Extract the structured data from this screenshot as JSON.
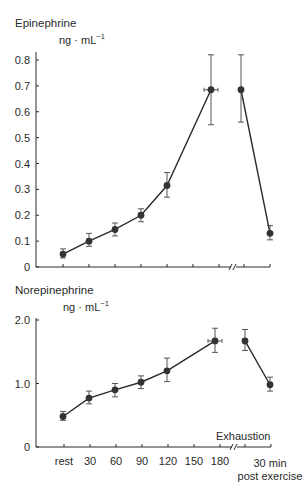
{
  "chart_data": [
    {
      "type": "line",
      "title": "Epinephrine",
      "ylabel": "ng · mL⁻¹",
      "ylim": [
        0,
        0.8
      ],
      "yticks": [
        "0",
        "0.1",
        "0.2",
        "0.3",
        "0.4",
        "0.5",
        "0.6",
        "0.7",
        "0.8"
      ],
      "categories": [
        "rest",
        "30",
        "60",
        "90",
        "120",
        "150",
        "180",
        "Exhaustion",
        "30 min post exercise"
      ],
      "axis_break": "between 180 and 30 min post exercise",
      "grid": false,
      "series": [
        {
          "name": "Epinephrine",
          "points": [
            {
              "x": "rest",
              "y": 0.05,
              "err_low": 0.035,
              "err_high": 0.07
            },
            {
              "x": "30",
              "y": 0.1,
              "err_low": 0.08,
              "err_high": 0.13
            },
            {
              "x": "60",
              "y": 0.145,
              "err_low": 0.12,
              "err_high": 0.17
            },
            {
              "x": "90",
              "y": 0.2,
              "err_low": 0.175,
              "err_high": 0.225
            },
            {
              "x": "120",
              "y": 0.315,
              "err_low": 0.27,
              "err_high": 0.365
            },
            {
              "x": "Exhaustion",
              "y": 0.685,
              "err_low": 0.55,
              "err_high": 0.82,
              "x_error": true
            },
            {
              "x": "Exhaustion (post)",
              "y": 0.685,
              "err_low": 0.56,
              "err_high": 0.82
            },
            {
              "x": "30 min post exercise",
              "y": 0.13,
              "err_low": 0.105,
              "err_high": 0.16
            }
          ]
        }
      ]
    },
    {
      "type": "line",
      "title": "Norepinephrine",
      "ylabel": "ng · mL⁻¹",
      "ylim": [
        0,
        2.0
      ],
      "yticks": [
        "0",
        "1.0",
        "2.0"
      ],
      "categories": [
        "rest",
        "30",
        "60",
        "90",
        "120",
        "150",
        "180",
        "Exhaustion",
        "30 min post exercise"
      ],
      "xlabel_ticks": [
        "rest",
        "30",
        "60",
        "90",
        "120",
        "150",
        "180",
        "30 min post exercise"
      ],
      "annotation": "Exhaustion",
      "axis_break": "between 180 and 30 min post exercise",
      "grid": false,
      "series": [
        {
          "name": "Norepinephrine",
          "points": [
            {
              "x": "rest",
              "y": 0.48,
              "err_low": 0.42,
              "err_high": 0.56
            },
            {
              "x": "30",
              "y": 0.77,
              "err_low": 0.68,
              "err_high": 0.88
            },
            {
              "x": "60",
              "y": 0.9,
              "err_low": 0.79,
              "err_high": 1.0
            },
            {
              "x": "90",
              "y": 1.02,
              "err_low": 0.92,
              "err_high": 1.12
            },
            {
              "x": "120",
              "y": 1.2,
              "err_low": 1.03,
              "err_high": 1.4
            },
            {
              "x": "Exhaustion",
              "y": 1.67,
              "err_low": 1.49,
              "err_high": 1.87,
              "x_error": true
            },
            {
              "x": "Exhaustion (post)",
              "y": 1.67,
              "err_low": 1.52,
              "err_high": 1.85
            },
            {
              "x": "30 min post exercise",
              "y": 0.98,
              "err_low": 0.88,
              "err_high": 1.1
            }
          ]
        }
      ]
    }
  ],
  "top": {
    "title": "Epinephrine",
    "unit": "ng · mL",
    "unit_exp": "−1",
    "yticks": [
      {
        "label": "0.8",
        "v": 0.8
      },
      {
        "label": "0.7",
        "v": 0.7
      },
      {
        "label": "0.6",
        "v": 0.6
      },
      {
        "label": "0.5",
        "v": 0.5
      },
      {
        "label": "0.4",
        "v": 0.4
      },
      {
        "label": "0.3",
        "v": 0.3
      },
      {
        "label": "0.2",
        "v": 0.2
      },
      {
        "label": "0.1",
        "v": 0.1
      },
      {
        "label": "0",
        "v": 0
      }
    ]
  },
  "bottom": {
    "title": "Norepinephrine",
    "unit": "ng · mL",
    "unit_exp": "−1",
    "yticks": [
      {
        "label": "2.0",
        "v": 2.0
      },
      {
        "label": "1.0",
        "v": 1.0
      },
      {
        "label": "0",
        "v": 0
      }
    ],
    "xticks": [
      "rest",
      "30",
      "60",
      "90",
      "120",
      "150",
      "180"
    ],
    "x_last_line1": "30 min",
    "x_last_line2": "post exercise",
    "annotation": "Exhaustion"
  },
  "colors": {
    "ink": "#2a2a2a",
    "marker": "#333333",
    "error": "#555555"
  }
}
